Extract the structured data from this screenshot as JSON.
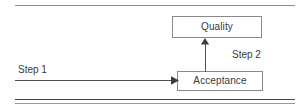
{
  "figure": {
    "type": "flow-diagram",
    "nodes": [
      {
        "id": "quality",
        "label": "Quality"
      },
      {
        "id": "acceptance",
        "label": "Acceptance"
      }
    ],
    "edges": [
      {
        "id": "step1",
        "label": "Step 1",
        "from": "",
        "to": "acceptance",
        "direction": "right"
      },
      {
        "id": "step2",
        "label": "Step 2",
        "from": "acceptance",
        "to": "quality",
        "direction": "up"
      }
    ],
    "rules": {
      "top": "single-line",
      "bottom": "double-line"
    },
    "colors": {
      "box_border": "#8a8a8a",
      "box_fill": "#ffffff",
      "text": "#3a3a3a",
      "connector": "#4f4f4f",
      "rule_top": "#8c8c8c",
      "rule_bottom_thick": "#4a4a4a",
      "rule_bottom_thin": "#9a9a9a",
      "page_background": "#ffffff"
    }
  }
}
